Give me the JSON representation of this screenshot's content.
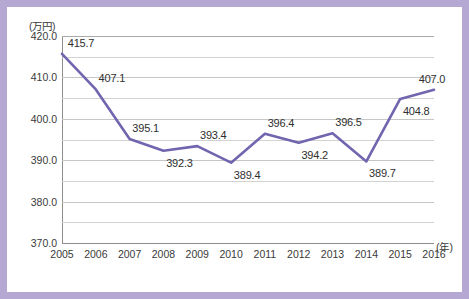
{
  "frame": {
    "border_color": "#b5a9d4",
    "background": "#ffffff"
  },
  "chart_data": {
    "type": "line",
    "title": "",
    "xlabel": "(年)",
    "ylabel": "(万円)",
    "categories": [
      "2005",
      "2006",
      "2007",
      "2008",
      "2009",
      "2010",
      "2011",
      "2012",
      "2013",
      "2014",
      "2015",
      "2016"
    ],
    "values": [
      415.7,
      407.1,
      395.1,
      392.3,
      393.4,
      389.4,
      396.4,
      394.2,
      396.5,
      389.7,
      404.8,
      407.0
    ],
    "point_labels": [
      "415.7",
      "407.1",
      "395.1",
      "392.3",
      "393.4",
      "389.4",
      "396.4",
      "394.2",
      "396.5",
      "389.7",
      "404.8",
      "407.0"
    ],
    "label_positions": [
      "above",
      "above",
      "above",
      "below",
      "above",
      "below",
      "above",
      "below",
      "above",
      "below",
      "below",
      "above"
    ],
    "ylim": [
      370.0,
      420.0
    ],
    "ytick_labels": [
      "420.0",
      "410.0",
      "400.0",
      "390.0",
      "380.0",
      "370.0"
    ],
    "ytick_values": [
      420.0,
      410.0,
      400.0,
      390.0,
      380.0,
      370.0
    ],
    "gridline_values": [
      420.0,
      415.0,
      410.0,
      405.0,
      400.0,
      395.0,
      390.0,
      385.0,
      380.0,
      375.0,
      370.0
    ],
    "grid": true,
    "legend": "none",
    "line_color": "#7264ae",
    "line_width": 2.6,
    "marker": "none"
  }
}
